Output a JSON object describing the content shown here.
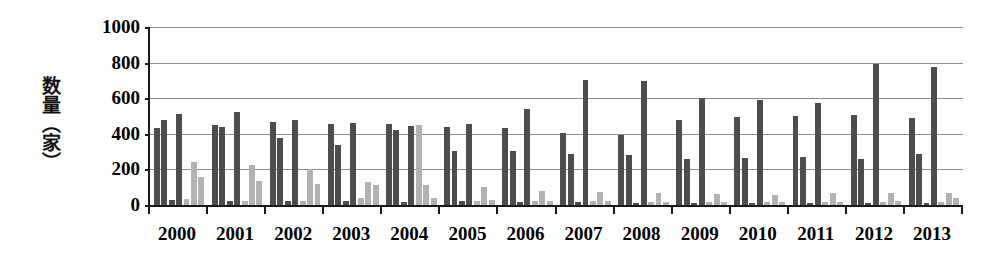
{
  "chart_data": {
    "type": "bar",
    "title": "",
    "xlabel": "",
    "ylabel": "数量（家）",
    "ylim": [
      0,
      1000
    ],
    "ytick_values": [
      0,
      200,
      400,
      600,
      800,
      1000
    ],
    "ytick_labels": [
      "0",
      "200",
      "400",
      "600",
      "800",
      "1000"
    ],
    "grid": true,
    "legend": "none",
    "categories": [
      "2000",
      "2001",
      "2002",
      "2003",
      "2004",
      "2005",
      "2006",
      "2007",
      "2008",
      "2009",
      "2010",
      "2011",
      "2012",
      "2013"
    ],
    "colors": {
      "dark": "#4d4d4d",
      "light": "#b2b2b2",
      "axis": "#1a1a1a",
      "gridline": "#8d8d8d",
      "background": "#ffffff"
    },
    "series": [
      {
        "name": "series-1",
        "style": "dark",
        "values": [
          430,
          450,
          465,
          455,
          455,
          440,
          435,
          405,
          395,
          475,
          495,
          500,
          505,
          490
        ]
      },
      {
        "name": "series-2",
        "style": "dark",
        "values": [
          480,
          440,
          375,
          335,
          420,
          305,
          305,
          285,
          280,
          260,
          265,
          270,
          260,
          285
        ]
      },
      {
        "name": "series-3",
        "style": "dark",
        "values": [
          30,
          25,
          20,
          20,
          15,
          20,
          15,
          15,
          10,
          10,
          10,
          10,
          10,
          10
        ]
      },
      {
        "name": "series-4",
        "style": "dark",
        "values": [
          510,
          525,
          480,
          460,
          445,
          455,
          540,
          705,
          695,
          600,
          590,
          575,
          795,
          775
        ]
      },
      {
        "name": "series-5",
        "style": "light",
        "values": [
          35,
          25,
          25,
          40,
          450,
          25,
          20,
          20,
          15,
          15,
          15,
          15,
          15,
          15
        ]
      },
      {
        "name": "series-6",
        "style": "light",
        "values": [
          240,
          225,
          205,
          130,
          110,
          100,
          80,
          75,
          70,
          60,
          55,
          65,
          70,
          70
        ]
      },
      {
        "name": "series-7",
        "style": "light",
        "values": [
          155,
          135,
          120,
          115,
          40,
          30,
          20,
          20,
          15,
          15,
          15,
          15,
          20,
          40
        ]
      }
    ]
  }
}
